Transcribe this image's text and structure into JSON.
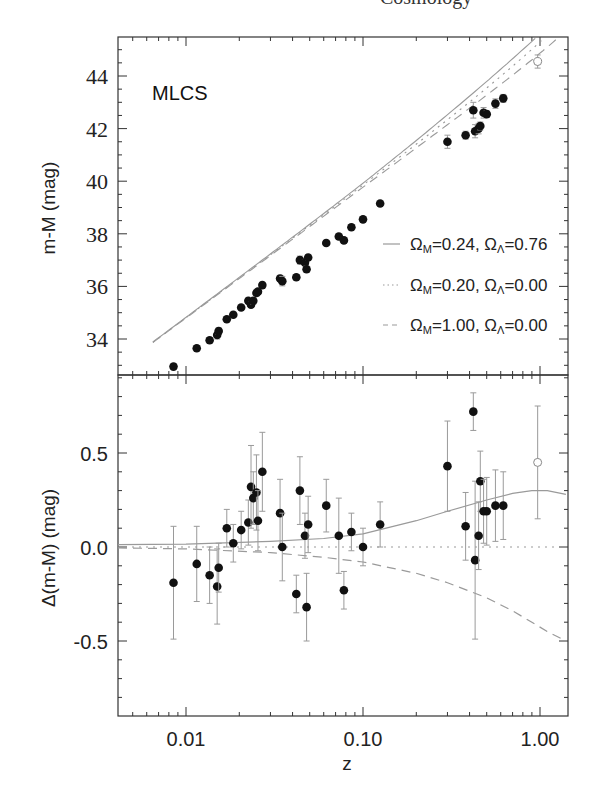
{
  "header_fragment": "Cosmology",
  "chart_data": [
    {
      "panel": "top",
      "type": "scatter",
      "title": "",
      "annotation": "MLCS",
      "xlabel": "",
      "ylabel": "m-M (mag)",
      "xscale": "log",
      "xlim": [
        0.0041,
        1.4
      ],
      "ylim": [
        32.6,
        45.5
      ],
      "yticks": [
        34,
        36,
        38,
        40,
        42,
        44
      ],
      "ytick_labels": [
        "34",
        "36",
        "38",
        "40",
        "42",
        "44"
      ],
      "grid": false,
      "legend": {
        "position": "lower right",
        "entries": [
          {
            "label_main": "Ω",
            "sub1": "M",
            "text1": "=0.24, ",
            "label2": "Ω",
            "sub2": "Λ",
            "text2": "=0.76",
            "style": "solid"
          },
          {
            "label_main": "Ω",
            "sub1": "M",
            "text1": "=0.20, ",
            "label2": "Ω",
            "sub2": "Λ",
            "text2": "=0.00",
            "style": "dotted"
          },
          {
            "label_main": "Ω",
            "sub1": "M",
            "text1": "=1.00, ",
            "label2": "Ω",
            "sub2": "Λ",
            "text2": "=0.00",
            "style": "dashed"
          }
        ]
      },
      "series": [
        {
          "name": "SNe Ia (filled)",
          "z": [
            0.0085,
            0.0115,
            0.0136,
            0.015,
            0.0153,
            0.017,
            0.0185,
            0.0205,
            0.0225,
            0.0233,
            0.024,
            0.025,
            0.0255,
            0.027,
            0.034,
            0.035,
            0.042,
            0.044,
            0.047,
            0.048,
            0.049,
            0.062,
            0.073,
            0.078,
            0.086,
            0.1,
            0.125,
            0.3,
            0.38,
            0.42,
            0.43,
            0.45,
            0.46,
            0.48,
            0.5,
            0.56,
            0.62
          ],
          "mu": [
            32.95,
            33.65,
            33.95,
            34.15,
            34.3,
            34.75,
            34.92,
            35.2,
            35.45,
            35.3,
            35.45,
            35.75,
            35.8,
            36.05,
            36.3,
            36.2,
            36.35,
            37.0,
            36.9,
            36.65,
            37.1,
            37.65,
            37.9,
            37.75,
            38.25,
            38.55,
            39.15,
            41.5,
            41.75,
            42.7,
            41.9,
            42.0,
            42.1,
            42.6,
            42.55,
            42.95,
            43.15
          ],
          "err": [
            0.1,
            0.1,
            0.1,
            0.15,
            0.12,
            0.08,
            0.08,
            0.08,
            0.1,
            0.1,
            0.12,
            0.12,
            0.1,
            0.1,
            0.12,
            0.18,
            0.1,
            0.15,
            0.1,
            0.12,
            0.1,
            0.1,
            0.1,
            0.1,
            0.1,
            0.08,
            0.08,
            0.25,
            0.15,
            0.3,
            0.25,
            0.2,
            0.15,
            0.2,
            0.12,
            0.18,
            0.15
          ]
        },
        {
          "name": "SN Ia (open)",
          "z": [
            0.97
          ],
          "mu": [
            44.55
          ],
          "err": [
            0.25
          ]
        }
      ],
      "models": [
        {
          "name": "ΩM=0.24, ΩΛ=0.76",
          "style": "solid"
        },
        {
          "name": "ΩM=0.20, ΩΛ=0.00",
          "style": "dotted"
        },
        {
          "name": "ΩM=1.00, ΩΛ=0.00",
          "style": "dashed"
        }
      ]
    },
    {
      "panel": "bottom",
      "type": "scatter",
      "xlabel": "z",
      "ylabel": "Δ(m-M) (mag)",
      "xscale": "log",
      "xlim": [
        0.0041,
        1.4
      ],
      "ylim": [
        -0.9,
        0.91
      ],
      "xticks": [
        0.01,
        0.1,
        1.0
      ],
      "xtick_labels": [
        "0.01",
        "0.10",
        "1.00"
      ],
      "yticks": [
        -0.5,
        0.0,
        0.5
      ],
      "ytick_labels": [
        "-0.5",
        "0.0",
        "0.5"
      ],
      "grid": false,
      "series": [
        {
          "name": "Residuals (filled)",
          "z": [
            0.0085,
            0.0115,
            0.0136,
            0.015,
            0.0153,
            0.017,
            0.0185,
            0.0205,
            0.0225,
            0.0233,
            0.024,
            0.025,
            0.0255,
            0.027,
            0.034,
            0.035,
            0.042,
            0.044,
            0.047,
            0.048,
            0.049,
            0.062,
            0.073,
            0.078,
            0.086,
            0.1,
            0.125,
            0.3,
            0.38,
            0.42,
            0.43,
            0.45,
            0.46,
            0.48,
            0.5,
            0.56,
            0.62
          ],
          "dmu": [
            -0.19,
            -0.09,
            -0.15,
            -0.21,
            -0.11,
            0.1,
            0.02,
            0.09,
            0.13,
            0.32,
            0.26,
            0.29,
            0.14,
            0.4,
            0.18,
            0.0,
            -0.25,
            0.3,
            0.06,
            -0.32,
            0.12,
            0.22,
            0.06,
            -0.23,
            0.08,
            0.0,
            0.12,
            0.43,
            0.11,
            0.72,
            -0.07,
            0.06,
            0.35,
            0.19,
            0.19,
            0.22,
            0.22
          ],
          "err": [
            0.3,
            0.2,
            0.15,
            0.2,
            0.13,
            0.1,
            0.1,
            0.1,
            0.12,
            0.22,
            0.14,
            0.2,
            0.16,
            0.21,
            0.18,
            0.18,
            0.1,
            0.18,
            0.12,
            0.18,
            0.15,
            0.14,
            0.2,
            0.1,
            0.1,
            0.1,
            0.12,
            0.24,
            0.18,
            0.1,
            0.42,
            0.18,
            0.16,
            0.17,
            0.18,
            0.19,
            0.18
          ]
        },
        {
          "name": "Residual (open)",
          "z": [
            0.97
          ],
          "dmu": [
            0.45
          ],
          "err": [
            0.3
          ]
        }
      ],
      "models": [
        {
          "name": "ΩM=0.24, ΩΛ=0.76",
          "style": "solid",
          "z": [
            0.004,
            0.01,
            0.03,
            0.06,
            0.1,
            0.2,
            0.3,
            0.5,
            0.7,
            0.9,
            1.1,
            1.4
          ],
          "dmu": [
            0.012,
            0.015,
            0.03,
            0.045,
            0.07,
            0.14,
            0.19,
            0.25,
            0.285,
            0.3,
            0.3,
            0.28
          ]
        },
        {
          "name": "ΩM=0.20, ΩΛ=0.00",
          "style": "dotted",
          "z": [
            0.004,
            1.4
          ],
          "dmu": [
            0.0,
            0.0
          ]
        },
        {
          "name": "ΩM=1.00, ΩΛ=0.00",
          "style": "dashed",
          "z": [
            0.004,
            0.01,
            0.03,
            0.06,
            0.1,
            0.2,
            0.3,
            0.5,
            0.7,
            0.9,
            1.1,
            1.4
          ],
          "dmu": [
            -0.005,
            -0.01,
            -0.03,
            -0.055,
            -0.08,
            -0.14,
            -0.19,
            -0.27,
            -0.34,
            -0.4,
            -0.45,
            -0.5
          ]
        }
      ]
    }
  ],
  "colors": {
    "axis": "#333333",
    "points": "#111111",
    "errorbar": "#9a9a9a",
    "model_line": "#9a9a9a",
    "text": "#222222"
  }
}
